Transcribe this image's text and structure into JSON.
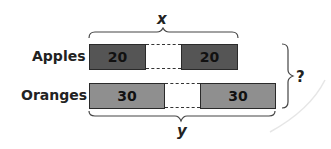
{
  "diagram": {
    "type": "tape-diagram",
    "top_label": "x",
    "bottom_label": "y",
    "right_label": "?",
    "rows": [
      {
        "label": "Apples",
        "segments": [
          "20",
          "20"
        ],
        "color": "#555555"
      },
      {
        "label": "Oranges",
        "segments": [
          "30",
          "30"
        ],
        "color": "#8f8f8f"
      }
    ]
  }
}
